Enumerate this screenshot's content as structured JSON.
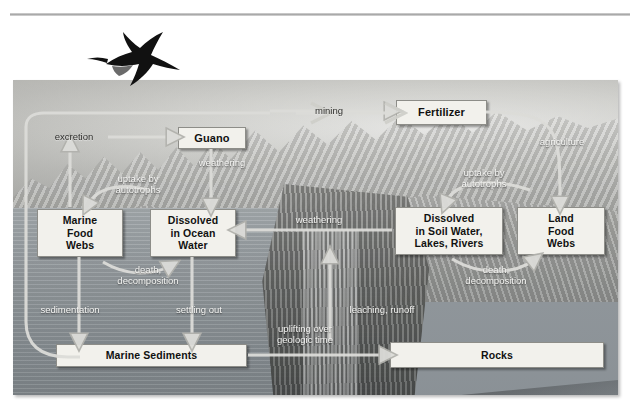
{
  "figure": {
    "type": "cycle-diagram",
    "bird_icon": "frigatebird-silhouette-icon"
  },
  "boxes": [
    {
      "id": "guano",
      "text": "Guano"
    },
    {
      "id": "fertilizer",
      "text": "Fertilizer"
    },
    {
      "id": "marine-food-webs",
      "text": "Marine\nFood\nWebs"
    },
    {
      "id": "dissolved-ocean",
      "text": "Dissolved\nin Ocean\nWater"
    },
    {
      "id": "dissolved-soil",
      "text": "Dissolved\nin Soil Water,\nLakes, Rivers"
    },
    {
      "id": "land-food-webs",
      "text": "Land\nFood\nWebs"
    },
    {
      "id": "marine-sediments",
      "text": "Marine Sediments"
    },
    {
      "id": "rocks",
      "text": "Rocks"
    }
  ],
  "labels": [
    {
      "id": "excretion",
      "text": "excretion"
    },
    {
      "id": "mining",
      "text": "mining"
    },
    {
      "id": "weathering-guano",
      "text": "weathering"
    },
    {
      "id": "agriculture",
      "text": "agriculture"
    },
    {
      "id": "uptake-marine",
      "text": "uptake by\nautotrophs"
    },
    {
      "id": "uptake-land",
      "text": "uptake by\nautotrophs"
    },
    {
      "id": "weathering-rock",
      "text": "weathering"
    },
    {
      "id": "death-marine",
      "text": "death,\ndecomposition"
    },
    {
      "id": "death-land",
      "text": "death,\ndecomposition"
    },
    {
      "id": "sedimentation",
      "text": "sedimentation"
    },
    {
      "id": "settling-out",
      "text": "settling out"
    },
    {
      "id": "leaching-runoff",
      "text": "leaching, runoff"
    },
    {
      "id": "uplifting",
      "text": "uplifting over\ngeologic  time"
    }
  ],
  "colors": {
    "box_fill": "#f2f1ec",
    "box_border": "#8d8d88",
    "arrow": "#d8d8d4",
    "label_light": "#f4f4f2",
    "label_dark": "#2e2e2c"
  }
}
